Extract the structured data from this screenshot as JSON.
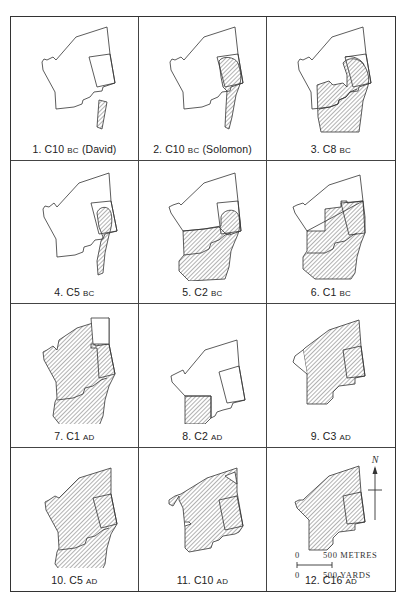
{
  "figure": {
    "panels": [
      {
        "number": "1.",
        "century": "C10",
        "era": "BC",
        "note": "(David)"
      },
      {
        "number": "2.",
        "century": "C10",
        "era": "BC",
        "note": "(Solomon)"
      },
      {
        "number": "3.",
        "century": "C8",
        "era": "BC",
        "note": ""
      },
      {
        "number": "4.",
        "century": "C5",
        "era": "BC",
        "note": ""
      },
      {
        "number": "5.",
        "century": "C2",
        "era": "BC",
        "note": ""
      },
      {
        "number": "6.",
        "century": "C1",
        "era": "BC",
        "note": ""
      },
      {
        "number": "7.",
        "century": "C1",
        "era": "AD",
        "note": ""
      },
      {
        "number": "8.",
        "century": "C2",
        "era": "AD",
        "note": ""
      },
      {
        "number": "9.",
        "century": "C3",
        "era": "AD",
        "note": ""
      },
      {
        "number": "10.",
        "century": "C5",
        "era": "AD",
        "note": ""
      },
      {
        "number": "11.",
        "century": "C10",
        "era": "AD",
        "note": ""
      },
      {
        "number": "12.",
        "century": "C16",
        "era": "AD",
        "note": ""
      }
    ],
    "north_arrow": {
      "label": "N"
    },
    "scale": {
      "metres_zero": "0",
      "metres_label": "500 METRES",
      "yards_zero": "0",
      "yards_label": "500 YARDS"
    },
    "colors": {
      "line": "#333333",
      "hatch": "#555555",
      "background": "#ffffff"
    }
  }
}
